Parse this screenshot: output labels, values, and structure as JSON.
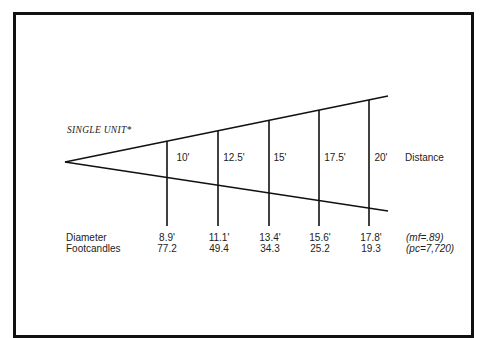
{
  "diagram": {
    "title": "SINGLE UNIT*",
    "distance_label": "Distance",
    "row_labels": {
      "diameter": "Diameter",
      "footcandles": "Footcandles"
    },
    "columns": [
      {
        "distance": "10'",
        "diameter": "8.9'",
        "footcandles": "77.2"
      },
      {
        "distance": "12.5'",
        "diameter": "11.1'",
        "footcandles": "49.4"
      },
      {
        "distance": "15'",
        "diameter": "13.4'",
        "footcandles": "34.3"
      },
      {
        "distance": "17.5'",
        "diameter": "15.6'",
        "footcandles": "25.2"
      },
      {
        "distance": "20'",
        "diameter": "17.8'",
        "footcandles": "19.3"
      }
    ],
    "notes": {
      "mf": "(mf=.89)",
      "pc": "(pc=7,720)"
    },
    "colors": {
      "line": "#111111",
      "text": "#222222",
      "background": "#ffffff"
    }
  }
}
